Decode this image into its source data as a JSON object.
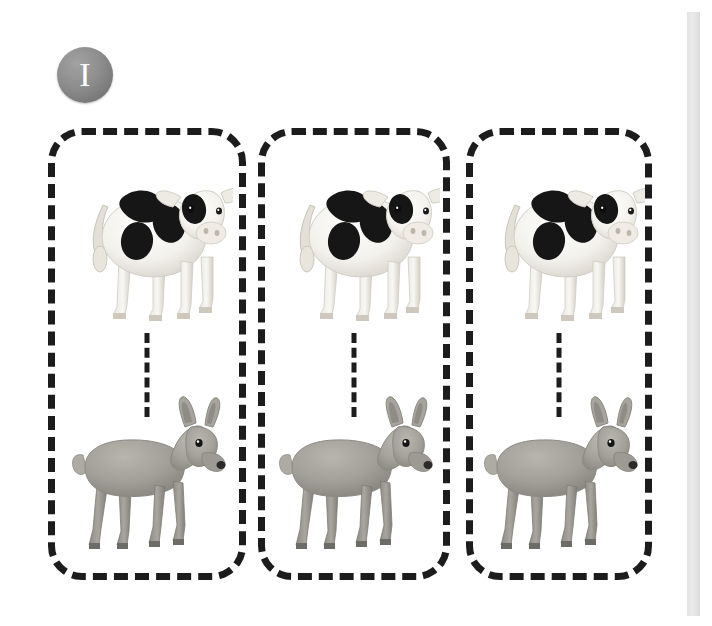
{
  "worksheet": {
    "background_color": "#ffffff",
    "badge": {
      "numeral": "I",
      "shape": "circle",
      "fill_color": "#8d8d8d",
      "text_color": "#ffffff"
    },
    "edge_bar": {
      "color": "#e3e3e3"
    },
    "box_style": {
      "border_style": "dashed",
      "border_color": "#1c1c1c",
      "border_width_px": 7,
      "corner_radius_px": 34
    },
    "connector_style": {
      "orientation": "vertical",
      "style": "dashed",
      "color": "#1c1c1c"
    },
    "animals": {
      "cow": {
        "label": "cow",
        "body_color": "#f4f2ee",
        "spot_color": "#1a1a1a",
        "facing": "right"
      },
      "deer": {
        "label": "deer",
        "body_color": "#9c9a92",
        "detail_color": "#2a2a28",
        "facing": "right"
      }
    },
    "groups": [
      {
        "id": "group-1",
        "top_animal": "cow",
        "bottom_animal": "deer",
        "connector": "dashed-line"
      },
      {
        "id": "group-2",
        "top_animal": "cow",
        "bottom_animal": "deer",
        "connector": "dashed-line"
      },
      {
        "id": "group-3",
        "top_animal": "cow",
        "bottom_animal": "deer",
        "connector": "dashed-line"
      }
    ]
  }
}
